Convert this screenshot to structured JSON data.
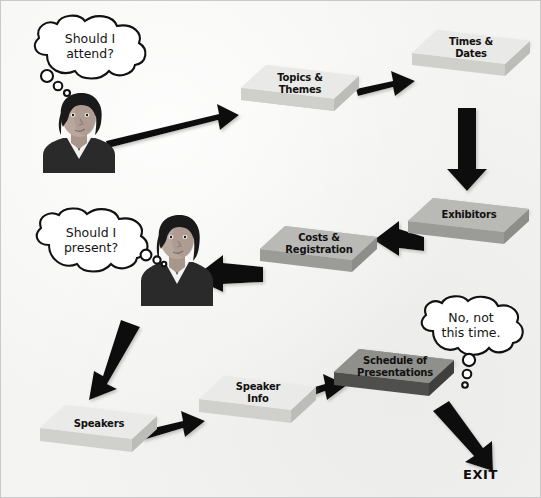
{
  "diagram": {
    "background_color": "#f4f4f2",
    "border_color": "#c9c9c9",
    "arrow_color": "#111111",
    "exit_label": "EXIT"
  },
  "palette": {
    "slab_light_top": "#e9e9e7",
    "slab_light_front": "#d6d6d3",
    "slab_light_side": "#c4c4c1",
    "slab_mid_top": "#b9b9b6",
    "slab_mid_front": "#9b9b98",
    "slab_mid_side": "#8d8d8a",
    "slab_dark_top": "#8f8f8c",
    "slab_dark_front": "#4f4f4d",
    "slab_dark_side": "#6a6a67",
    "text_color": "#111111"
  },
  "boxes": [
    {
      "id": "topics-themes",
      "label": "Topics &\nThemes",
      "shade": "light"
    },
    {
      "id": "times-dates",
      "label": "Times &\nDates",
      "shade": "light"
    },
    {
      "id": "exhibitors",
      "label": "Exhibitors",
      "shade": "mid"
    },
    {
      "id": "costs-registration",
      "label": "Costs &\nRegistration",
      "shade": "mid"
    },
    {
      "id": "speakers",
      "label": "Speakers",
      "shade": "light"
    },
    {
      "id": "speaker-info",
      "label": "Speaker\nInfo",
      "shade": "light"
    },
    {
      "id": "schedule-of-presentations",
      "label": "Schedule of\nPresentations",
      "shade": "dark"
    }
  ],
  "bubbles": [
    {
      "id": "should-i-attend",
      "text": "Should I\nattend?",
      "tail": "down-left"
    },
    {
      "id": "should-i-present",
      "text": "Should I\npresent?",
      "tail": "right"
    },
    {
      "id": "no-not-this-time",
      "text": "No, not\nthis time.",
      "tail": "down"
    }
  ],
  "people": [
    {
      "id": "person-attendee",
      "skin": "#b8a79c",
      "hair": "#1a1a1a",
      "shirt": "#2a2a2a",
      "collar": "#f2f2f0"
    },
    {
      "id": "person-presenter",
      "skin": "#b8a79c",
      "hair": "#1a1a1a",
      "shirt": "#2a2a2a",
      "collar": "#f2f2f0"
    }
  ],
  "arrows": [
    {
      "id": "arrow-person1-to-topics",
      "from": "person-attendee",
      "to": "topics-themes",
      "direction": "right-up"
    },
    {
      "id": "arrow-topics-to-times",
      "from": "topics-themes",
      "to": "times-dates",
      "direction": "right-up"
    },
    {
      "id": "arrow-times-to-exhibitors",
      "from": "times-dates",
      "to": "exhibitors",
      "direction": "down"
    },
    {
      "id": "arrow-exhibitors-to-costs",
      "from": "exhibitors",
      "to": "costs-registration",
      "direction": "left"
    },
    {
      "id": "arrow-costs-to-person2",
      "from": "costs-registration",
      "to": "person-presenter",
      "direction": "left"
    },
    {
      "id": "arrow-person2-to-speakers",
      "from": "person-presenter",
      "to": "speakers",
      "direction": "down-left"
    },
    {
      "id": "arrow-speakers-to-speaker-info",
      "from": "speakers",
      "to": "speaker-info",
      "direction": "right-up"
    },
    {
      "id": "arrow-speaker-info-to-schedule",
      "from": "speaker-info",
      "to": "schedule-of-presentations",
      "direction": "right-up"
    },
    {
      "id": "arrow-schedule-to-exit",
      "from": "schedule-of-presentations",
      "to": "exit",
      "direction": "down-right"
    }
  ]
}
